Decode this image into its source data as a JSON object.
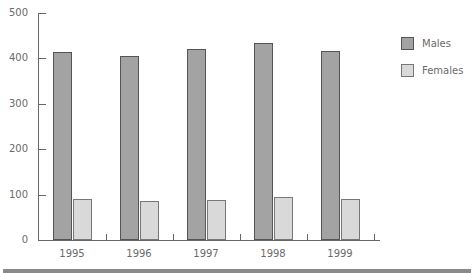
{
  "chart_data": {
    "type": "bar",
    "title": "",
    "xlabel": "",
    "ylabel": "",
    "categories": [
      "1995",
      "1996",
      "1997",
      "1998",
      "1999"
    ],
    "series": [
      {
        "name": "Males",
        "values": [
          414,
          405,
          421,
          434,
          416
        ],
        "color": "#a3a3a3"
      },
      {
        "name": "Females",
        "values": [
          90,
          86,
          88,
          95,
          90
        ],
        "color": "#d9d9d9"
      }
    ],
    "ylim": [
      0,
      500
    ],
    "yticks": [
      "0",
      "100",
      "200",
      "300",
      "400",
      "500"
    ],
    "grid": false,
    "legend_position": "right"
  },
  "legend": {
    "males": "Males",
    "females": "Females"
  }
}
